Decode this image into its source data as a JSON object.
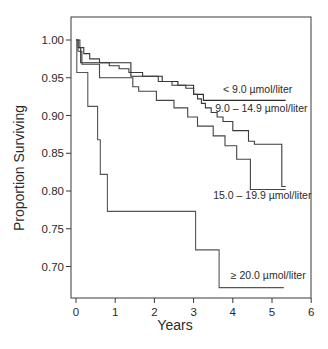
{
  "chart_data": {
    "type": "line",
    "subtype": "kaplan-meier-step",
    "title": "",
    "xlabel": "Years",
    "ylabel": "Proportion Surviving",
    "xlim": [
      0,
      6
    ],
    "ylim": [
      0.665,
      1.02
    ],
    "xticks": [
      0,
      1,
      2,
      3,
      4,
      5,
      6
    ],
    "xtick_labels": [
      "0",
      "1",
      "2",
      "3",
      "4",
      "5",
      "6"
    ],
    "yticks": [
      0.7,
      0.75,
      0.8,
      0.85,
      0.9,
      0.95,
      1.0
    ],
    "ytick_labels": [
      "0.70",
      "0.75",
      "0.80",
      "0.85",
      "0.90",
      "0.95",
      "1.00"
    ],
    "grid": false,
    "legend_position": "inline labels at right end of curves",
    "series": [
      {
        "name": "< 9.0 µmol/liter",
        "label": "< 9.0 µmol/liter",
        "points": [
          [
            0,
            1.0
          ],
          [
            0.05,
            1.0
          ],
          [
            0.05,
            0.99
          ],
          [
            0.12,
            0.99
          ],
          [
            0.12,
            0.97
          ],
          [
            1.4,
            0.97
          ],
          [
            1.4,
            0.952
          ],
          [
            2.2,
            0.952
          ],
          [
            2.2,
            0.945
          ],
          [
            2.6,
            0.945
          ],
          [
            2.6,
            0.94
          ],
          [
            3.0,
            0.94
          ],
          [
            3.0,
            0.928
          ],
          [
            3.25,
            0.928
          ],
          [
            3.25,
            0.92
          ],
          [
            5.35,
            0.92
          ]
        ]
      },
      {
        "name": "9.0 – 14.9 µmol/liter",
        "label": "9.0 – 14.9 µmol/liter",
        "points": [
          [
            0,
            1.0
          ],
          [
            0.1,
            1.0
          ],
          [
            0.1,
            0.99
          ],
          [
            0.2,
            0.99
          ],
          [
            0.2,
            0.982
          ],
          [
            0.35,
            0.982
          ],
          [
            0.35,
            0.975
          ],
          [
            0.6,
            0.975
          ],
          [
            0.6,
            0.97
          ],
          [
            0.85,
            0.97
          ],
          [
            0.85,
            0.966
          ],
          [
            1.1,
            0.966
          ],
          [
            1.1,
            0.962
          ],
          [
            1.35,
            0.962
          ],
          [
            1.35,
            0.957
          ],
          [
            1.7,
            0.957
          ],
          [
            1.7,
            0.952
          ],
          [
            2.1,
            0.952
          ],
          [
            2.1,
            0.945
          ],
          [
            2.45,
            0.945
          ],
          [
            2.45,
            0.94
          ],
          [
            2.8,
            0.94
          ],
          [
            2.8,
            0.936
          ],
          [
            3.0,
            0.936
          ],
          [
            3.0,
            0.928
          ],
          [
            3.1,
            0.928
          ],
          [
            3.1,
            0.922
          ],
          [
            3.2,
            0.922
          ],
          [
            3.2,
            0.916
          ],
          [
            3.3,
            0.916
          ],
          [
            3.3,
            0.91
          ],
          [
            3.45,
            0.91
          ],
          [
            3.45,
            0.904
          ],
          [
            3.6,
            0.904
          ],
          [
            3.6,
            0.898
          ],
          [
            3.75,
            0.898
          ],
          [
            3.75,
            0.892
          ],
          [
            4.0,
            0.892
          ],
          [
            4.0,
            0.88
          ],
          [
            4.4,
            0.88
          ],
          [
            4.4,
            0.866
          ],
          [
            4.55,
            0.866
          ],
          [
            4.55,
            0.862
          ],
          [
            5.25,
            0.862
          ],
          [
            5.25,
            0.806
          ],
          [
            5.35,
            0.806
          ]
        ]
      },
      {
        "name": "15.0 – 19.9 µmol/liter",
        "label": "15.0 – 19.9 µmol/liter",
        "points": [
          [
            0,
            1.0
          ],
          [
            0.05,
            1.0
          ],
          [
            0.05,
            0.985
          ],
          [
            0.15,
            0.985
          ],
          [
            0.15,
            0.968
          ],
          [
            0.6,
            0.968
          ],
          [
            0.6,
            0.95
          ],
          [
            1.45,
            0.95
          ],
          [
            1.45,
            0.938
          ],
          [
            1.6,
            0.938
          ],
          [
            1.6,
            0.932
          ],
          [
            2.05,
            0.932
          ],
          [
            2.05,
            0.92
          ],
          [
            2.5,
            0.92
          ],
          [
            2.5,
            0.91
          ],
          [
            2.85,
            0.91
          ],
          [
            2.85,
            0.898
          ],
          [
            3.1,
            0.898
          ],
          [
            3.1,
            0.886
          ],
          [
            3.5,
            0.886
          ],
          [
            3.5,
            0.873
          ],
          [
            3.8,
            0.873
          ],
          [
            3.8,
            0.86
          ],
          [
            4.1,
            0.86
          ],
          [
            4.1,
            0.842
          ],
          [
            4.45,
            0.842
          ],
          [
            4.45,
            0.802
          ],
          [
            5.35,
            0.802
          ]
        ]
      },
      {
        "name": "≥ 20.0 µmol/liter",
        "label": "≥ 20.0 µmol/liter",
        "points": [
          [
            0,
            1.0
          ],
          [
            0.02,
            1.0
          ],
          [
            0.02,
            0.957
          ],
          [
            0.3,
            0.957
          ],
          [
            0.3,
            0.912
          ],
          [
            0.55,
            0.912
          ],
          [
            0.55,
            0.868
          ],
          [
            0.62,
            0.868
          ],
          [
            0.62,
            0.822
          ],
          [
            0.8,
            0.822
          ],
          [
            0.8,
            0.773
          ],
          [
            3.05,
            0.773
          ],
          [
            3.05,
            0.722
          ],
          [
            3.65,
            0.722
          ],
          [
            3.65,
            0.672
          ],
          [
            5.3,
            0.672
          ]
        ]
      }
    ],
    "annotations": [
      {
        "text": "< 9.0 µmol/liter",
        "x": 3.75,
        "y": 0.93
      },
      {
        "text": "9.0 – 14.9 µmol/liter",
        "x": 3.55,
        "y": 0.905
      },
      {
        "text": "15.0 – 19.9 µmol/liter",
        "x": 3.5,
        "y": 0.79
      },
      {
        "text": "≥ 20.0 µmol/liter",
        "x": 3.95,
        "y": 0.683
      }
    ]
  }
}
